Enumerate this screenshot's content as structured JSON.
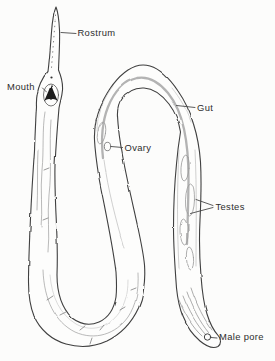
{
  "diagram": {
    "labels": {
      "rostrum": "Rostrum",
      "mouth": "Mouth",
      "gut": "Gut",
      "ovary": "Ovary",
      "testes": "Testes",
      "male_pore": "Male pore"
    },
    "colors": {
      "ink": "#3f3f3f",
      "gut": "#b3b3b3",
      "detail": "#9c9c9c",
      "faint": "#c4c4c4",
      "text": "#2d2d2d",
      "background": "#fcfcfb",
      "body_fill": "#fdfdfc",
      "mouth_dark": "#1c1c1c"
    }
  }
}
